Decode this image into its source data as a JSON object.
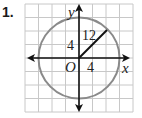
{
  "problem": {
    "number": "1."
  },
  "figure": {
    "grid": {
      "columns": 8,
      "rows": 8,
      "line_color": "#c8c8c8"
    },
    "axes": {
      "x_label": "x",
      "y_label": "y",
      "origin_label": "O",
      "color": "#111111"
    },
    "circle": {
      "center": "O",
      "radius_units": 3,
      "color": "#8a8a8a"
    },
    "radius_segment": {
      "label": "12",
      "color": "#111111"
    },
    "labels": {
      "y_tick": "4",
      "x_tick": "4"
    }
  }
}
